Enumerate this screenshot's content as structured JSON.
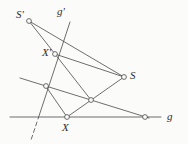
{
  "figure": {
    "width": 188,
    "height": 144,
    "background_color": "#fbfbfa",
    "stroke_color": "#4a4a4a",
    "label_color": "#2b2b2b"
  },
  "labels": [
    {
      "id": "label-s-prime",
      "text": "S'",
      "x": 16,
      "y": 9
    },
    {
      "id": "label-g-prime",
      "text": "g'",
      "x": 57,
      "y": 6
    },
    {
      "id": "label-x-prime",
      "text": "X'",
      "x": 42,
      "y": 47
    },
    {
      "id": "label-s",
      "text": "S",
      "x": 130,
      "y": 70
    },
    {
      "id": "label-x",
      "text": "X",
      "x": 62,
      "y": 122
    },
    {
      "id": "label-g",
      "text": "g",
      "x": 167,
      "y": 111
    }
  ],
  "points": [
    {
      "id": "point-s-prime",
      "name": "S'",
      "x": 29,
      "y": 21,
      "r": 2.4
    },
    {
      "id": "point-x-prime",
      "name": "X'",
      "x": 55,
      "y": 54,
      "r": 2.4
    },
    {
      "id": "point-s",
      "name": "S",
      "x": 124,
      "y": 77,
      "r": 2.4
    },
    {
      "id": "point-x",
      "name": "X",
      "x": 67,
      "y": 117,
      "r": 2.4
    },
    {
      "id": "point-center",
      "name": "intersection-center",
      "x": 91,
      "y": 100,
      "r": 2.4
    },
    {
      "id": "point-left-axis",
      "name": "intersection-left-axis",
      "x": 46,
      "y": 86,
      "r": 2.4
    },
    {
      "id": "point-right-g",
      "name": "intersection-right-on-g",
      "x": 145,
      "y": 117,
      "r": 2.4
    }
  ],
  "lines": [
    {
      "id": "line-g",
      "name": "line-g",
      "x1": 10,
      "y1": 117,
      "x2": 161,
      "y2": 117,
      "dashed": false
    },
    {
      "id": "line-g-prime",
      "name": "line-g-prime",
      "x1": 70,
      "y1": 22,
      "x2": 38,
      "y2": 119,
      "dashed": false
    },
    {
      "id": "line-g-prime-ext",
      "name": "line-g-prime-extension",
      "x1": 37,
      "y1": 122,
      "x2": 31,
      "y2": 140,
      "dashed": true
    },
    {
      "id": "line-axis",
      "name": "line-axis-of-perspectivity",
      "x1": 20,
      "y1": 78,
      "x2": 149,
      "y2": 118,
      "dashed": false
    },
    {
      "id": "line-sprime-xprime",
      "name": "segment-s-prime-to-x-prime",
      "x1": 29,
      "y1": 21,
      "x2": 55,
      "y2": 54,
      "dashed": false
    },
    {
      "id": "line-sprime-s",
      "name": "segment-s-prime-to-s",
      "x1": 29,
      "y1": 21,
      "x2": 124,
      "y2": 77,
      "dashed": false
    },
    {
      "id": "line-xprime-s",
      "name": "segment-x-prime-to-s",
      "x1": 55,
      "y1": 54,
      "x2": 124,
      "y2": 77,
      "dashed": false
    },
    {
      "id": "line-xprime-center",
      "name": "segment-x-prime-to-center",
      "x1": 55,
      "y1": 54,
      "x2": 91,
      "y2": 100,
      "dashed": false
    },
    {
      "id": "line-x-center-s",
      "name": "segment-x-through-center-to-s",
      "x1": 67,
      "y1": 117,
      "x2": 124,
      "y2": 77,
      "dashed": false
    },
    {
      "id": "line-xprime-x",
      "name": "segment-x-prime-to-x",
      "x1": 47,
      "y1": 88,
      "x2": 67,
      "y2": 117,
      "dashed": false
    }
  ]
}
